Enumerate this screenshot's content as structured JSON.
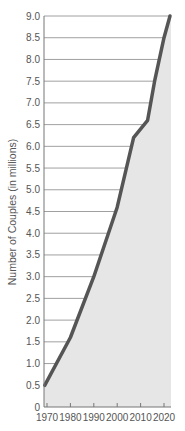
{
  "chart_data": {
    "type": "area",
    "title": "",
    "xlabel": "",
    "ylabel": "Number of Couples (in millions)",
    "xlim": [
      1970,
      2023
    ],
    "ylim": [
      0,
      9.0
    ],
    "grid": true,
    "legend": null,
    "x_ticks": [
      "1970",
      "1980",
      "1990",
      "2000",
      "2010",
      "2020"
    ],
    "y_ticks": [
      "0",
      "0.5",
      "1.0",
      "1.5",
      "2.0",
      "2.5",
      "3.0",
      "3.5",
      "4.0",
      "4.5",
      "5.0",
      "5.5",
      "6.0",
      "6.5",
      "7.0",
      "7.5",
      "8.0",
      "8.5",
      "9.0"
    ],
    "series": [
      {
        "name": "Number of Couples",
        "x": [
          1969,
          1980,
          1990,
          2000,
          2007,
          2013,
          2016,
          2020,
          2023
        ],
        "values": [
          0.5,
          1.6,
          3.0,
          4.6,
          6.2,
          6.6,
          7.5,
          8.5,
          9.0
        ]
      }
    ],
    "colors": {
      "line": "#555555",
      "fill": "#e6e6e6",
      "grid": "#888888",
      "axis": "#777777",
      "text": "#555555"
    }
  }
}
